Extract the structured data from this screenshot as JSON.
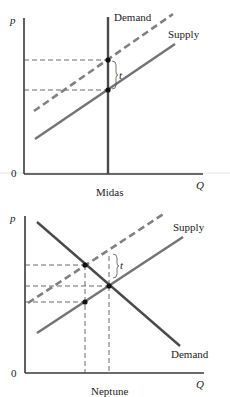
{
  "figures": [
    {
      "id": "midas",
      "caption": "Midas",
      "y_axis_label": "p",
      "x_axis_label": "Q",
      "origin_label": "0",
      "demand_label": "Demand",
      "supply_label": "Supply",
      "tax_label": "t",
      "demand_type": "perfectly inelastic (vertical)"
    },
    {
      "id": "neptune",
      "caption": "Neptune",
      "y_axis_label": "p",
      "x_axis_label": "Q",
      "origin_label": "0",
      "demand_label": "Demand",
      "supply_label": "Supply",
      "tax_label": "t",
      "demand_type": "downward sloping"
    }
  ],
  "colors": {
    "axis": "#3a3a3a",
    "demand": "#4a4a4a",
    "supply": "#737373",
    "supply_with_tax": "#808080",
    "points": "#111111"
  }
}
